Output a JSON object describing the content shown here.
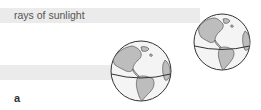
{
  "diagram": {
    "rays_label": "rays of sunlight",
    "panel_label": "a",
    "globes": [
      {
        "name": "globe-upper-right",
        "cx": 222,
        "cy": 42,
        "r": 28
      },
      {
        "name": "globe-lower-center",
        "cx": 141,
        "cy": 71,
        "r": 30
      }
    ],
    "colors": {
      "ray_band": "#ebebeb",
      "ocean": "#f4f4f4",
      "land": "#bdbdbd",
      "outline": "#333333"
    }
  }
}
